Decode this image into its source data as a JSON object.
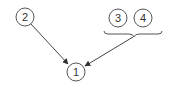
{
  "diagram": {
    "nodes": [
      {
        "id": "1",
        "label": "1",
        "cx": 76,
        "cy": 72
      },
      {
        "id": "2",
        "label": "2",
        "cx": 25,
        "cy": 17
      },
      {
        "id": "3",
        "label": "3",
        "cx": 118,
        "cy": 18
      },
      {
        "id": "4",
        "label": "4",
        "cx": 143,
        "cy": 18
      }
    ],
    "edges": [
      {
        "from": "2",
        "to": "1"
      },
      {
        "from": "group-3-4",
        "to": "1"
      }
    ],
    "groups": [
      {
        "id": "group-3-4",
        "members": [
          "3",
          "4"
        ],
        "style": "brace"
      }
    ],
    "colors": {
      "stroke": "#555555",
      "text": "#333333",
      "background": "#ffffff"
    }
  }
}
